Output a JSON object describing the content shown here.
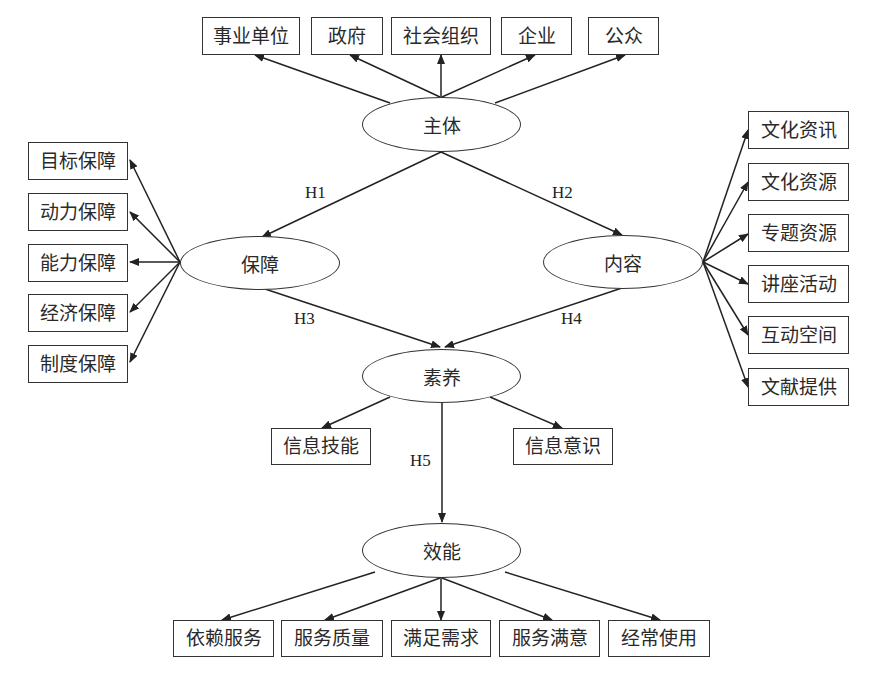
{
  "diagram": {
    "type": "structural-model",
    "latent_nodes": {
      "subject": "主体",
      "guarantee": "保障",
      "content": "内容",
      "literacy": "素养",
      "efficacy": "效能"
    },
    "subject_indicators": [
      "事业单位",
      "政府",
      "社会组织",
      "企业",
      "公众"
    ],
    "guarantee_indicators": [
      "目标保障",
      "动力保障",
      "能力保障",
      "经济保障",
      "制度保障"
    ],
    "content_indicators": [
      "文化资讯",
      "文化资源",
      "专题资源",
      "讲座活动",
      "互动空间",
      "文献提供"
    ],
    "literacy_indicators": [
      "信息技能",
      "信息意识"
    ],
    "efficacy_indicators": [
      "依赖服务",
      "服务质量",
      "满足需求",
      "服务满意",
      "经常使用"
    ],
    "hypotheses": {
      "h1": "H1",
      "h2": "H2",
      "h3": "H3",
      "h4": "H4",
      "h5": "H5"
    },
    "edges": [
      {
        "from": "主体",
        "to": "保障",
        "label": "H1"
      },
      {
        "from": "主体",
        "to": "内容",
        "label": "H2"
      },
      {
        "from": "保障",
        "to": "素养",
        "label": "H3"
      },
      {
        "from": "内容",
        "to": "素养",
        "label": "H4"
      },
      {
        "from": "素养",
        "to": "效能",
        "label": "H5"
      }
    ]
  }
}
